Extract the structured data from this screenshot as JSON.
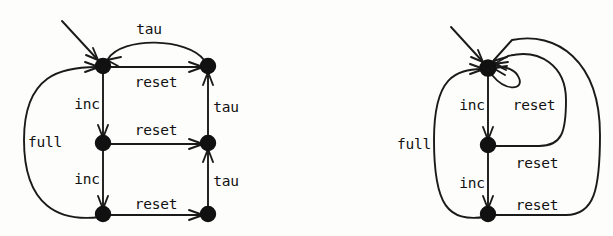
{
  "figure": {
    "background_color": "#fdfdfc",
    "ink_color": "#111111",
    "node_radius": 7.5
  },
  "diagrams": [
    {
      "id": "left-diagram",
      "name": "unreduced-lts",
      "nodes": [
        {
          "id": "l-top-left",
          "name": "state-top-left",
          "cx": 103,
          "cy": 66
        },
        {
          "id": "l-top-right",
          "name": "state-top-right",
          "cx": 208,
          "cy": 66
        },
        {
          "id": "l-mid-left",
          "name": "state-middle-left",
          "cx": 103,
          "cy": 143
        },
        {
          "id": "l-mid-right",
          "name": "state-middle-right",
          "cx": 208,
          "cy": 143
        },
        {
          "id": "l-bot-left",
          "name": "state-bottom-left",
          "cx": 103,
          "cy": 214
        },
        {
          "id": "l-bot-right",
          "name": "state-bottom-right",
          "cx": 208,
          "cy": 214
        }
      ],
      "initial_arrow": {
        "name": "initial-state-arrow",
        "from_x": 62,
        "from_y": 21,
        "to_x": 99,
        "to_y": 61
      },
      "labels": [
        {
          "id": "l-lab-tau-top",
          "text": "tau",
          "x": 149,
          "y": 30,
          "anchor": "middle"
        },
        {
          "id": "l-lab-reset-1",
          "text": "reset",
          "x": 156,
          "y": 83,
          "anchor": "middle"
        },
        {
          "id": "l-lab-inc-1",
          "text": "inc",
          "x": 87,
          "y": 105,
          "anchor": "middle"
        },
        {
          "id": "l-lab-tau-1",
          "text": "tau",
          "x": 226,
          "y": 108,
          "anchor": "middle"
        },
        {
          "id": "l-lab-reset-2",
          "text": "reset",
          "x": 156,
          "y": 131,
          "anchor": "middle"
        },
        {
          "id": "l-lab-full",
          "text": "full",
          "x": 45,
          "y": 143,
          "anchor": "middle"
        },
        {
          "id": "l-lab-inc-2",
          "text": "inc",
          "x": 87,
          "y": 180,
          "anchor": "middle"
        },
        {
          "id": "l-lab-tau-2",
          "text": "tau",
          "x": 226,
          "y": 182,
          "anchor": "middle"
        },
        {
          "id": "l-lab-reset-3",
          "text": "reset",
          "x": 156,
          "y": 205,
          "anchor": "middle"
        }
      ],
      "transitions": [
        {
          "name": "transition-top-left-to-top-right",
          "label": "reset",
          "from": "l-top-left",
          "to": "l-top-right"
        },
        {
          "name": "transition-top-right-to-top-left",
          "label": "tau",
          "from": "l-top-right",
          "to": "l-top-left"
        },
        {
          "name": "transition-top-left-to-middle-left",
          "label": "inc",
          "from": "l-top-left",
          "to": "l-mid-left"
        },
        {
          "name": "transition-middle-left-to-middle-right",
          "label": "reset",
          "from": "l-mid-left",
          "to": "l-mid-right"
        },
        {
          "name": "transition-middle-right-to-top-right",
          "label": "tau",
          "from": "l-mid-right",
          "to": "l-top-right"
        },
        {
          "name": "transition-middle-left-to-bottom-left",
          "label": "inc",
          "from": "l-mid-left",
          "to": "l-bot-left"
        },
        {
          "name": "transition-bottom-left-to-bottom-right",
          "label": "reset",
          "from": "l-bot-left",
          "to": "l-bot-right"
        },
        {
          "name": "transition-bottom-right-to-middle-right",
          "label": "tau",
          "from": "l-bot-right",
          "to": "l-mid-right"
        },
        {
          "name": "transition-bottom-left-to-top-left",
          "label": "full",
          "from": "l-bot-left",
          "to": "l-top-left"
        }
      ]
    },
    {
      "id": "right-diagram",
      "name": "reduced-lts",
      "nodes": [
        {
          "id": "r-top",
          "name": "state-top",
          "cx": 488,
          "cy": 68
        },
        {
          "id": "r-mid",
          "name": "state-middle",
          "cx": 488,
          "cy": 145
        },
        {
          "id": "r-bot",
          "name": "state-bottom",
          "cx": 488,
          "cy": 214
        }
      ],
      "initial_arrow": {
        "name": "initial-state-arrow",
        "from_x": 451,
        "from_y": 27,
        "to_x": 484,
        "to_y": 62
      },
      "labels": [
        {
          "id": "r-lab-inc-1",
          "text": "inc",
          "x": 472,
          "y": 106,
          "anchor": "middle"
        },
        {
          "id": "r-lab-reset-1",
          "text": "reset",
          "x": 534,
          "y": 106,
          "anchor": "middle"
        },
        {
          "id": "r-lab-full",
          "text": "full",
          "x": 414,
          "y": 145,
          "anchor": "middle"
        },
        {
          "id": "r-lab-reset-2",
          "text": "reset",
          "x": 537,
          "y": 164,
          "anchor": "middle"
        },
        {
          "id": "r-lab-inc-2",
          "text": "inc",
          "x": 472,
          "y": 184,
          "anchor": "middle"
        },
        {
          "id": "r-lab-reset-3",
          "text": "reset",
          "x": 537,
          "y": 206,
          "anchor": "middle"
        }
      ],
      "transitions": [
        {
          "name": "transition-top-self-loop-reset",
          "label": "reset",
          "from": "r-top",
          "to": "r-top"
        },
        {
          "name": "transition-top-to-middle-inc",
          "label": "inc",
          "from": "r-top",
          "to": "r-mid"
        },
        {
          "name": "transition-middle-to-top-reset",
          "label": "reset",
          "from": "r-mid",
          "to": "r-top"
        },
        {
          "name": "transition-middle-to-bottom-inc",
          "label": "inc",
          "from": "r-mid",
          "to": "r-bot"
        },
        {
          "name": "transition-bottom-to-top-reset",
          "label": "reset",
          "from": "r-bot",
          "to": "r-top"
        },
        {
          "name": "transition-bottom-to-top-full",
          "label": "full",
          "from": "r-bot",
          "to": "r-top"
        }
      ]
    }
  ]
}
